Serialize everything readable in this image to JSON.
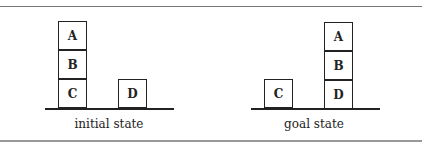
{
  "figure": {
    "panels": [
      {
        "caption": "initial state",
        "stacks": [
          {
            "blocks_top_to_bottom": [
              "A",
              "B",
              "C"
            ]
          },
          {
            "blocks_top_to_bottom": [
              "D"
            ]
          }
        ]
      },
      {
        "caption": "goal state",
        "stacks": [
          {
            "blocks_top_to_bottom": [
              "C"
            ]
          },
          {
            "blocks_top_to_bottom": [
              "A",
              "B",
              "D"
            ]
          }
        ]
      }
    ]
  }
}
